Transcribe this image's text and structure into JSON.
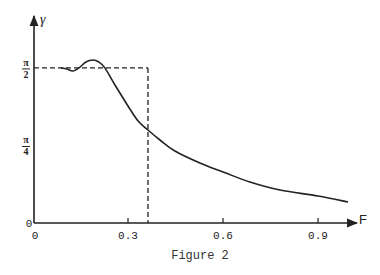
{
  "chart_data": {
    "type": "line",
    "title": "",
    "caption": "Figure 2",
    "xlabel": "F",
    "ylabel": "γ",
    "xlim": [
      0,
      1.0
    ],
    "ylim": [
      0,
      1.7
    ],
    "grid": false,
    "x_ticks": [
      {
        "value": 0,
        "label": "0"
      },
      {
        "value": 0.3,
        "label": "0.3"
      },
      {
        "value": 0.6,
        "label": "0.6"
      },
      {
        "value": 0.9,
        "label": "0.9"
      }
    ],
    "y_ticks": [
      {
        "value": 0,
        "label": "0",
        "num": "",
        "den": ""
      },
      {
        "value": 0.7854,
        "label": "π/4",
        "num": "π",
        "den": "4"
      },
      {
        "value": 1.5708,
        "label": "π/2",
        "num": "π",
        "den": "2"
      }
    ],
    "series": [
      {
        "name": "gamma",
        "x": [
          0.088,
          0.107,
          0.126,
          0.145,
          0.167,
          0.189,
          0.208,
          0.227,
          0.259,
          0.3,
          0.332,
          0.363,
          0.401,
          0.448,
          0.527,
          0.6,
          0.685,
          0.78,
          0.9,
          0.995
        ],
        "y": [
          1.571,
          1.56,
          1.54,
          1.571,
          1.631,
          1.651,
          1.631,
          1.571,
          1.398,
          1.185,
          1.033,
          0.942,
          0.841,
          0.729,
          0.608,
          0.517,
          0.415,
          0.334,
          0.274,
          0.213
        ]
      }
    ],
    "reference_lines": {
      "horizontal": {
        "y": 1.5708,
        "x_from": 0,
        "x_to": 0.363,
        "style": "dashed"
      },
      "vertical": {
        "x": 0.363,
        "y_from": 0,
        "y_to": 1.5708,
        "style": "dashed"
      }
    }
  }
}
